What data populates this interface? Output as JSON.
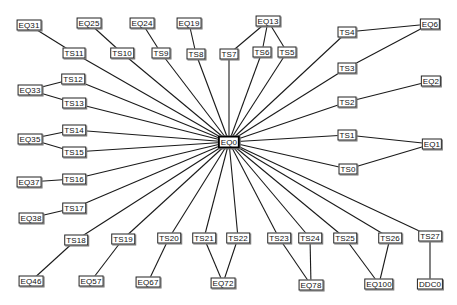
{
  "diagram": {
    "title": "",
    "hub": "EQ0",
    "nodes": [
      {
        "id": "EQ0",
        "label": "EQ0",
        "x": 229,
        "y": 142,
        "hub": true
      },
      {
        "id": "EQ31",
        "label": "EQ31",
        "x": 29,
        "y": 25
      },
      {
        "id": "EQ25",
        "label": "EQ25",
        "x": 89,
        "y": 23
      },
      {
        "id": "EQ24",
        "label": "EQ24",
        "x": 142,
        "y": 23
      },
      {
        "id": "EQ19",
        "label": "EQ19",
        "x": 189,
        "y": 23
      },
      {
        "id": "EQ13",
        "label": "EQ13",
        "x": 268,
        "y": 21
      },
      {
        "id": "EQ6",
        "label": "EQ6",
        "x": 430,
        "y": 24
      },
      {
        "id": "TS11",
        "label": "TS11",
        "x": 74,
        "y": 53
      },
      {
        "id": "TS10",
        "label": "TS10",
        "x": 122,
        "y": 53
      },
      {
        "id": "TS9",
        "label": "TS9",
        "x": 161,
        "y": 53
      },
      {
        "id": "TS8",
        "label": "TS8",
        "x": 196,
        "y": 54
      },
      {
        "id": "TS7",
        "label": "TS7",
        "x": 229,
        "y": 54
      },
      {
        "id": "TS6",
        "label": "TS6",
        "x": 262,
        "y": 52
      },
      {
        "id": "TS5",
        "label": "TS5",
        "x": 287,
        "y": 52
      },
      {
        "id": "TS4",
        "label": "TS4",
        "x": 347,
        "y": 32
      },
      {
        "id": "TS3",
        "label": "TS3",
        "x": 347,
        "y": 68
      },
      {
        "id": "EQ2",
        "label": "EQ2",
        "x": 431,
        "y": 81
      },
      {
        "id": "TS2",
        "label": "TS2",
        "x": 347,
        "y": 102
      },
      {
        "id": "EQ33",
        "label": "EQ33",
        "x": 30,
        "y": 90
      },
      {
        "id": "TS12",
        "label": "TS12",
        "x": 73,
        "y": 79
      },
      {
        "id": "TS13",
        "label": "TS13",
        "x": 74,
        "y": 103
      },
      {
        "id": "EQ35",
        "label": "EQ35",
        "x": 30,
        "y": 139
      },
      {
        "id": "TS14",
        "label": "TS14",
        "x": 74,
        "y": 130
      },
      {
        "id": "TS15",
        "label": "TS15",
        "x": 74,
        "y": 152
      },
      {
        "id": "TS1",
        "label": "TS1",
        "x": 347,
        "y": 135
      },
      {
        "id": "EQ1",
        "label": "EQ1",
        "x": 432,
        "y": 144
      },
      {
        "id": "TS0",
        "label": "TS0",
        "x": 348,
        "y": 169
      },
      {
        "id": "EQ37",
        "label": "EQ37",
        "x": 29,
        "y": 182
      },
      {
        "id": "TS16",
        "label": "TS16",
        "x": 74,
        "y": 179
      },
      {
        "id": "EQ38",
        "label": "EQ38",
        "x": 31,
        "y": 218
      },
      {
        "id": "TS17",
        "label": "TS17",
        "x": 74,
        "y": 208
      },
      {
        "id": "TS18",
        "label": "TS18",
        "x": 76,
        "y": 240
      },
      {
        "id": "TS19",
        "label": "TS19",
        "x": 123,
        "y": 239
      },
      {
        "id": "TS20",
        "label": "TS20",
        "x": 169,
        "y": 238
      },
      {
        "id": "TS21",
        "label": "TS21",
        "x": 204,
        "y": 238
      },
      {
        "id": "TS22",
        "label": "TS22",
        "x": 238,
        "y": 238
      },
      {
        "id": "TS23",
        "label": "TS23",
        "x": 279,
        "y": 238
      },
      {
        "id": "TS24",
        "label": "TS24",
        "x": 310,
        "y": 238
      },
      {
        "id": "TS25",
        "label": "TS25",
        "x": 345,
        "y": 238
      },
      {
        "id": "TS26",
        "label": "TS26",
        "x": 390,
        "y": 238
      },
      {
        "id": "TS27",
        "label": "TS27",
        "x": 430,
        "y": 236
      },
      {
        "id": "EQ46",
        "label": "EQ46",
        "x": 31,
        "y": 281
      },
      {
        "id": "EQ57",
        "label": "EQ57",
        "x": 91,
        "y": 281
      },
      {
        "id": "EQ67",
        "label": "EQ67",
        "x": 148,
        "y": 282
      },
      {
        "id": "EQ72",
        "label": "EQ72",
        "x": 223,
        "y": 283
      },
      {
        "id": "EQ78",
        "label": "EQ78",
        "x": 311,
        "y": 285
      },
      {
        "id": "EQ100",
        "label": "EQ100",
        "x": 379,
        "y": 284
      },
      {
        "id": "DDC0",
        "label": "DDC0",
        "x": 430,
        "y": 284
      }
    ],
    "edges": [
      [
        "EQ0",
        "TS0"
      ],
      [
        "EQ0",
        "TS1"
      ],
      [
        "EQ0",
        "TS2"
      ],
      [
        "EQ0",
        "TS3"
      ],
      [
        "EQ0",
        "TS4"
      ],
      [
        "EQ0",
        "TS5"
      ],
      [
        "EQ0",
        "TS6"
      ],
      [
        "EQ0",
        "TS7"
      ],
      [
        "EQ0",
        "TS8"
      ],
      [
        "EQ0",
        "TS9"
      ],
      [
        "EQ0",
        "TS10"
      ],
      [
        "EQ0",
        "TS11"
      ],
      [
        "EQ0",
        "TS12"
      ],
      [
        "EQ0",
        "TS13"
      ],
      [
        "EQ0",
        "TS14"
      ],
      [
        "EQ0",
        "TS15"
      ],
      [
        "EQ0",
        "TS16"
      ],
      [
        "EQ0",
        "TS17"
      ],
      [
        "EQ0",
        "TS18"
      ],
      [
        "EQ0",
        "TS19"
      ],
      [
        "EQ0",
        "TS20"
      ],
      [
        "EQ0",
        "TS21"
      ],
      [
        "EQ0",
        "TS22"
      ],
      [
        "EQ0",
        "TS23"
      ],
      [
        "EQ0",
        "TS24"
      ],
      [
        "EQ0",
        "TS25"
      ],
      [
        "EQ0",
        "TS26"
      ],
      [
        "EQ0",
        "TS27"
      ],
      [
        "TS0",
        "EQ1"
      ],
      [
        "TS1",
        "EQ1"
      ],
      [
        "TS2",
        "EQ2"
      ],
      [
        "TS3",
        "EQ6"
      ],
      [
        "TS4",
        "EQ6"
      ],
      [
        "TS5",
        "EQ13"
      ],
      [
        "TS6",
        "EQ13"
      ],
      [
        "TS7",
        "EQ13"
      ],
      [
        "TS8",
        "EQ19"
      ],
      [
        "TS9",
        "EQ24"
      ],
      [
        "TS10",
        "EQ25"
      ],
      [
        "TS11",
        "EQ31"
      ],
      [
        "TS12",
        "EQ33"
      ],
      [
        "TS13",
        "EQ33"
      ],
      [
        "TS14",
        "EQ35"
      ],
      [
        "TS15",
        "EQ35"
      ],
      [
        "TS16",
        "EQ37"
      ],
      [
        "TS17",
        "EQ38"
      ],
      [
        "TS18",
        "EQ46"
      ],
      [
        "TS19",
        "EQ57"
      ],
      [
        "TS20",
        "EQ67"
      ],
      [
        "TS21",
        "EQ72"
      ],
      [
        "TS22",
        "EQ72"
      ],
      [
        "TS23",
        "EQ78"
      ],
      [
        "TS24",
        "EQ78"
      ],
      [
        "TS25",
        "EQ100"
      ],
      [
        "TS26",
        "EQ100"
      ],
      [
        "TS27",
        "DDC0"
      ]
    ],
    "colors": {
      "background": "#ffffff",
      "edge": "#1a1a1a",
      "node_border": "#222222",
      "node_fill": "#ffffff"
    }
  }
}
